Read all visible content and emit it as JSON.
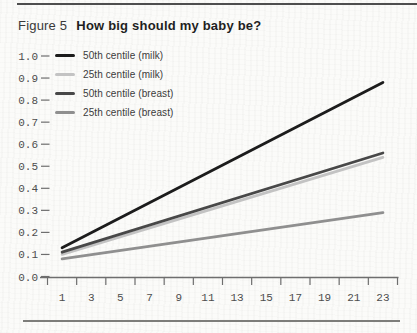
{
  "figure": {
    "label": "Figure 5",
    "title": "How big should my baby be?"
  },
  "colors": {
    "paper": "#fbfbf9",
    "rule": "#4e4e4e",
    "axis": "#6e6e6e",
    "tick_label": "#4d4d4d",
    "title_text": "#1f1f1f",
    "legend_text": "#3b3b3b"
  },
  "chart_data": {
    "type": "line",
    "title": "How big should my baby be?",
    "xlabel": "",
    "ylabel": "",
    "xlim": [
      0,
      24
    ],
    "ylim": [
      0,
      1.0
    ],
    "grid": false,
    "legend_position": "top-left",
    "x_tick_marks": [
      0,
      2,
      4,
      6,
      8,
      10,
      12,
      14,
      16,
      18,
      20,
      22,
      24
    ],
    "x_label_positions": [
      1,
      3,
      5,
      7,
      9,
      11,
      13,
      15,
      17,
      19,
      21,
      23
    ],
    "x_tick_labels": [
      "1",
      "3",
      "5",
      "7",
      "9",
      "11",
      "13",
      "15",
      "17",
      "19",
      "21",
      "23"
    ],
    "y_tick_values": [
      0,
      0.1,
      0.2,
      0.3,
      0.4,
      0.5,
      0.6,
      0.7,
      0.8,
      0.9,
      1.0
    ],
    "y_tick_labels": [
      "0.0",
      "0.1",
      "0.2",
      "0.3",
      "0.4",
      "0.5",
      "0.6",
      "0.7",
      "0.8",
      "0.9",
      "1.0"
    ],
    "series": [
      {
        "name": "50th centile (milk)",
        "color": "#1c1c1c",
        "points": [
          [
            1,
            0.13
          ],
          [
            23,
            0.88
          ]
        ]
      },
      {
        "name": "25th centile (milk)",
        "color": "#c3c3c3",
        "points": [
          [
            1,
            0.1
          ],
          [
            23,
            0.54
          ]
        ]
      },
      {
        "name": "50th centile (breast)",
        "color": "#484848",
        "points": [
          [
            1,
            0.11
          ],
          [
            23,
            0.56
          ]
        ]
      },
      {
        "name": "25th centile (breast)",
        "color": "#8f8f8f",
        "points": [
          [
            1,
            0.08
          ],
          [
            23,
            0.29
          ]
        ]
      }
    ]
  }
}
